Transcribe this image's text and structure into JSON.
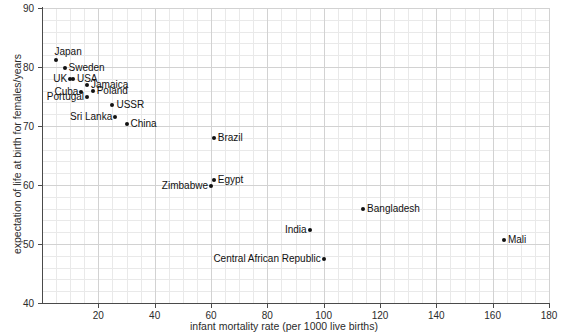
{
  "chart_data": {
    "type": "scatter",
    "title": "",
    "xlabel": "infant mortality rate (per 1000 live births)",
    "ylabel": "expectation of life at birth for females/years",
    "xlim": [
      0,
      180
    ],
    "ylim": [
      40,
      90
    ],
    "xticks": [
      20,
      40,
      60,
      80,
      100,
      120,
      140,
      160,
      180
    ],
    "yticks": [
      40,
      50,
      60,
      70,
      80,
      90
    ],
    "grid": true,
    "grid_minor": true,
    "legend": "none",
    "point_color": "#111111",
    "points": [
      {
        "label": "Japan",
        "x": 5,
        "y": 81.2,
        "label_pos": "top"
      },
      {
        "label": "Sweden",
        "x": 8,
        "y": 79.9,
        "label_pos": "right"
      },
      {
        "label": "UK",
        "x": 10,
        "y": 77.9,
        "label_pos": "left"
      },
      {
        "label": "USA",
        "x": 11,
        "y": 77.9,
        "label_pos": "right"
      },
      {
        "label": "Jamaica",
        "x": 16,
        "y": 76.9,
        "label_pos": "right"
      },
      {
        "label": "Cuba",
        "x": 14,
        "y": 75.8,
        "label_pos": "left"
      },
      {
        "label": "Poland",
        "x": 18,
        "y": 75.9,
        "label_pos": "right"
      },
      {
        "label": "Portugal",
        "x": 16,
        "y": 75.0,
        "label_pos": "left"
      },
      {
        "label": "USSR",
        "x": 25,
        "y": 73.5,
        "label_pos": "right"
      },
      {
        "label": "Sri Lanka",
        "x": 26,
        "y": 71.5,
        "label_pos": "left"
      },
      {
        "label": "China",
        "x": 30,
        "y": 70.4,
        "label_pos": "right"
      },
      {
        "label": "Brazil",
        "x": 61,
        "y": 68.0,
        "label_pos": "right"
      },
      {
        "label": "Egypt",
        "x": 61,
        "y": 60.8,
        "label_pos": "right"
      },
      {
        "label": "Zimbabwe",
        "x": 60,
        "y": 59.8,
        "label_pos": "left"
      },
      {
        "label": "Bangladesh",
        "x": 114,
        "y": 56.0,
        "label_pos": "right"
      },
      {
        "label": "India",
        "x": 95,
        "y": 52.3,
        "label_pos": "left"
      },
      {
        "label": "Mali",
        "x": 164,
        "y": 50.6,
        "label_pos": "right"
      },
      {
        "label": "Central African Republic",
        "x": 100,
        "y": 47.4,
        "label_pos": "left"
      }
    ]
  },
  "axis": {
    "x_title": "infant mortality rate (per 1000 live births)",
    "y_title": "expectation of life at birth for females/years"
  }
}
